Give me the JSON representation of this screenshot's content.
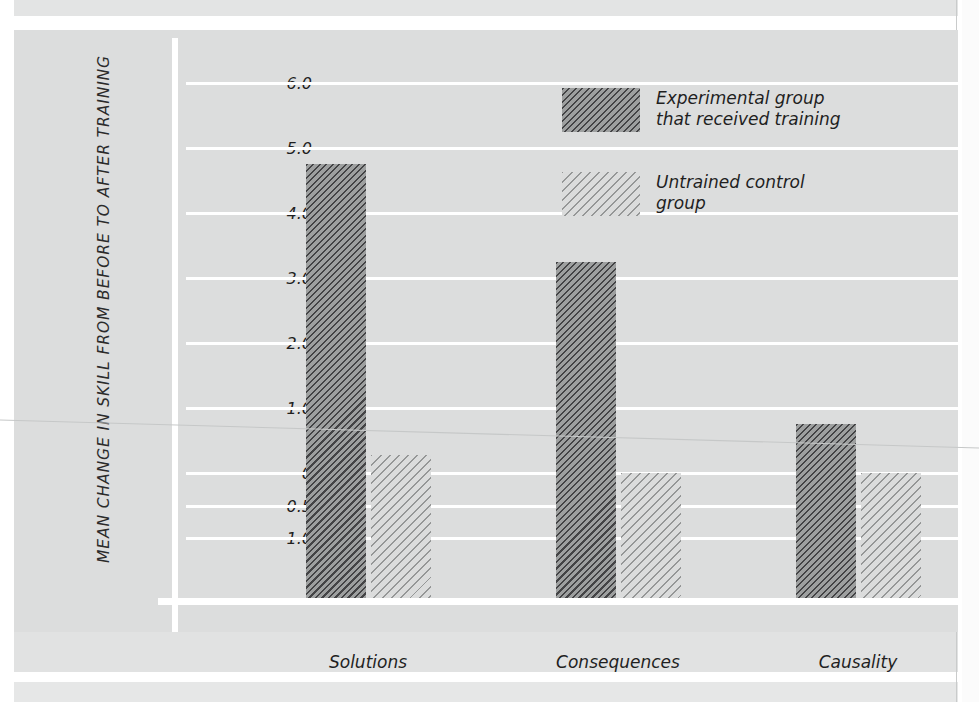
{
  "figure": {
    "background_color": "#dcdddd",
    "plot_background_color": "#dcdddd",
    "gridline_color": "#ffffff",
    "axis_color": "#ffffff",
    "dark_series_color": "#6e7070",
    "light_series_color": "#d4d5d5"
  },
  "chart_data": {
    "type": "bar",
    "title": "",
    "subtitle": "",
    "xlabel": "",
    "ylabel": "MEAN CHANGE IN SKILL FROM BEFORE TO AFTER TRAINING",
    "categories": [
      "Solutions",
      "Consequences",
      "Causality"
    ],
    "series": [
      {
        "name": "Experimental group that received training",
        "values": [
          4.75,
          3.25,
          0.75
        ],
        "pattern": "dense-diagonal-hatch",
        "color": "#6e7070"
      },
      {
        "name": "Untrained control group",
        "values": [
          0.28,
          0.0,
          -0.5
        ],
        "pattern": "sparse-diagonal-hatch",
        "color": "#d4d5d5"
      }
    ],
    "ylim": [
      -1.6,
      6.45
    ],
    "yticks": [
      6.0,
      5.0,
      4.0,
      3.0,
      2.0,
      1.0,
      0,
      -0.5,
      -1.0
    ],
    "ytick_labels": [
      "6.0",
      "5.0",
      "4.0",
      "3.0",
      "2.0",
      "1.0",
      "0",
      "−0.5",
      "−1.0"
    ],
    "grid": true,
    "grid_axis": "y",
    "legend_position": "upper-center"
  },
  "legend": {
    "entries": [
      {
        "label": "Experimental group\nthat received training",
        "swatch": "dark-hatch-swatch"
      },
      {
        "label": "Untrained control\ngroup",
        "swatch": "light-hatch-swatch"
      }
    ]
  }
}
